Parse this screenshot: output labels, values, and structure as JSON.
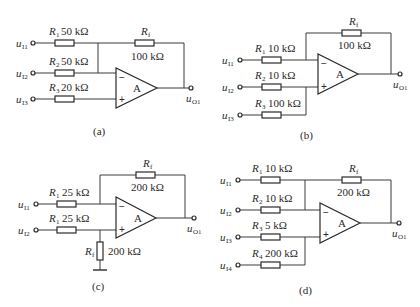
{
  "figure": {
    "panels": [
      {
        "caption": "(a)",
        "inputs": [
          {
            "name": "u",
            "sub": "I1",
            "resistor": "R",
            "rsub": "1",
            "value": "50 kΩ"
          },
          {
            "name": "u",
            "sub": "I2",
            "resistor": "R",
            "rsub": "2",
            "value": "50 kΩ"
          },
          {
            "name": "u",
            "sub": "I3",
            "resistor": "R",
            "rsub": "3",
            "value": "20 kΩ"
          }
        ],
        "feedback": {
          "resistor": "R",
          "rsub": "f",
          "value": "100 kΩ"
        },
        "amp_label": "A",
        "minus": "−",
        "plus": "+",
        "output": {
          "name": "u",
          "sub": "O1"
        }
      },
      {
        "caption": "(b)",
        "inputs": [
          {
            "name": "u",
            "sub": "I1",
            "resistor": "R",
            "rsub": "1",
            "value": "10 kΩ"
          },
          {
            "name": "u",
            "sub": "I2",
            "resistor": "R",
            "rsub": "2",
            "value": "10 kΩ"
          },
          {
            "name": "u",
            "sub": "I3",
            "resistor": "R",
            "rsub": "3",
            "value": "100 kΩ"
          }
        ],
        "feedback": {
          "resistor": "R",
          "rsub": "f",
          "value": "100 kΩ"
        },
        "amp_label": "A",
        "minus": "−",
        "plus": "+",
        "output": {
          "name": "u",
          "sub": "O1"
        }
      },
      {
        "caption": "(c)",
        "inputs": [
          {
            "name": "u",
            "sub": "I1",
            "resistor": "R",
            "rsub": "1",
            "value": "25 kΩ"
          },
          {
            "name": "u",
            "sub": "I2",
            "resistor": "R",
            "rsub": "1",
            "value": "25 kΩ"
          }
        ],
        "feedback": {
          "resistor": "R",
          "rsub": "f",
          "value": "200 kΩ"
        },
        "ground_resistor": {
          "resistor": "R",
          "rsub": "f",
          "value": "200 kΩ"
        },
        "amp_label": "A",
        "minus": "−",
        "plus": "+",
        "output": {
          "name": "u",
          "sub": "O1"
        }
      },
      {
        "caption": "(d)",
        "inputs": [
          {
            "name": "u",
            "sub": "I1",
            "resistor": "R",
            "rsub": "1",
            "value": "10 kΩ"
          },
          {
            "name": "u",
            "sub": "I2",
            "resistor": "R",
            "rsub": "2",
            "value": "10 kΩ"
          },
          {
            "name": "u",
            "sub": "I3",
            "resistor": "R",
            "rsub": "3",
            "value": "5 kΩ"
          },
          {
            "name": "u",
            "sub": "I4",
            "resistor": "R",
            "rsub": "4",
            "value": "200 kΩ"
          }
        ],
        "feedback": {
          "resistor": "R",
          "rsub": "f",
          "value": "200 kΩ"
        },
        "amp_label": "A",
        "minus": "−",
        "plus": "+",
        "output": {
          "name": "u",
          "sub": "O1"
        }
      }
    ]
  }
}
